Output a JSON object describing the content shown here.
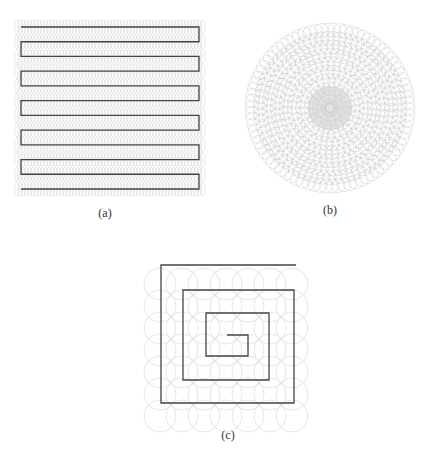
{
  "panels": [
    {
      "id": "a",
      "label": "(a)",
      "pattern": "boustrophedon",
      "path_color": "#444444",
      "circle_color": "#cfcfcf"
    },
    {
      "id": "b",
      "label": "(b)",
      "pattern": "circular",
      "circle_color": "#b5b5b5"
    },
    {
      "id": "c",
      "label": "(c)",
      "pattern": "square-spiral",
      "path_color": "#444444",
      "circle_color": "#d5d5d5"
    }
  ],
  "layout": {
    "a": {
      "x0": 21,
      "x1": 199,
      "y0": 27,
      "y1": 189,
      "lines": 12,
      "label_x": 105,
      "label_y": 206
    },
    "b": {
      "cx": 330,
      "cy": 108,
      "r": 84,
      "label_x": 330,
      "label_y": 203
    },
    "c": {
      "points": [
        [
          296,
          265
        ],
        [
          161,
          265
        ],
        [
          161,
          403
        ],
        [
          294,
          403
        ],
        [
          294,
          290
        ],
        [
          183,
          290
        ],
        [
          183,
          380
        ],
        [
          269,
          380
        ],
        [
          269,
          313
        ],
        [
          206,
          313
        ],
        [
          206,
          356
        ],
        [
          248,
          356
        ],
        [
          248,
          335
        ],
        [
          227,
          335
        ]
      ],
      "grid_x0": 160,
      "grid_y0": 262,
      "grid_step": 22,
      "cols": 7,
      "rows": 7,
      "circle_r": 16,
      "label_x": 228,
      "label_y": 428
    }
  }
}
